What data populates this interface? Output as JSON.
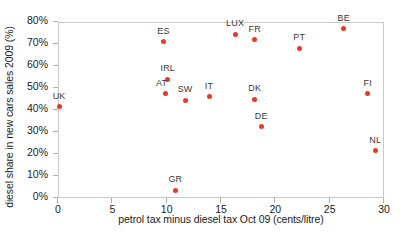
{
  "chart_data": {
    "type": "scatter",
    "title": "",
    "xlabel": "petrol tax minus diesel tax Oct 09 (cents/litre)",
    "ylabel": "diesel share in new cars sales 2009 (%)",
    "xlim": [
      0,
      30
    ],
    "ylim": [
      0,
      80
    ],
    "xticks": [
      "0",
      "5",
      "10",
      "15",
      "20",
      "25",
      "30"
    ],
    "xtick_values": [
      0,
      5,
      10,
      15,
      20,
      25,
      30
    ],
    "yticks": [
      "0%",
      "10%",
      "20%",
      "30%",
      "40%",
      "50%",
      "60%",
      "70%",
      "80%"
    ],
    "ytick_values": [
      0,
      10,
      20,
      30,
      40,
      50,
      60,
      70,
      80
    ],
    "grid": false,
    "legend": "none",
    "marker_color": "#e8382a",
    "points": [
      {
        "label": "UK",
        "x": 0.1,
        "y": 41.5,
        "label_dx": 0,
        "label_dy": -6
      },
      {
        "label": "ES",
        "x": 9.7,
        "y": 71.0,
        "label_dx": 0,
        "label_dy": -6
      },
      {
        "label": "IRL",
        "x": 10.1,
        "y": 54.0,
        "label_dx": 0,
        "label_dy": -6
      },
      {
        "label": "AT",
        "x": 9.9,
        "y": 47.5,
        "label_dx": -4,
        "label_dy": -6
      },
      {
        "label": "GR",
        "x": 10.8,
        "y": 3.5,
        "label_dx": 0,
        "label_dy": -6
      },
      {
        "label": "SW",
        "x": 11.7,
        "y": 44.5,
        "label_dx": 0,
        "label_dy": -6
      },
      {
        "label": "IT",
        "x": 13.9,
        "y": 46.0,
        "label_dx": 0,
        "label_dy": -6
      },
      {
        "label": "LUX",
        "x": 16.3,
        "y": 74.5,
        "label_dx": 0,
        "label_dy": -6
      },
      {
        "label": "FR",
        "x": 18.1,
        "y": 72.0,
        "label_dx": 0,
        "label_dy": -6
      },
      {
        "label": "DK",
        "x": 18.1,
        "y": 45.0,
        "label_dx": 0,
        "label_dy": -6
      },
      {
        "label": "DE",
        "x": 18.7,
        "y": 32.5,
        "label_dx": 0,
        "label_dy": -6
      },
      {
        "label": "PT",
        "x": 22.2,
        "y": 68.0,
        "label_dx": 0,
        "label_dy": -6
      },
      {
        "label": "BE",
        "x": 26.3,
        "y": 77.0,
        "label_dx": 0,
        "label_dy": -6
      },
      {
        "label": "FI",
        "x": 28.5,
        "y": 47.5,
        "label_dx": 0,
        "label_dy": -6
      },
      {
        "label": "NL",
        "x": 29.2,
        "y": 21.5,
        "label_dx": 0,
        "label_dy": -6
      }
    ]
  }
}
